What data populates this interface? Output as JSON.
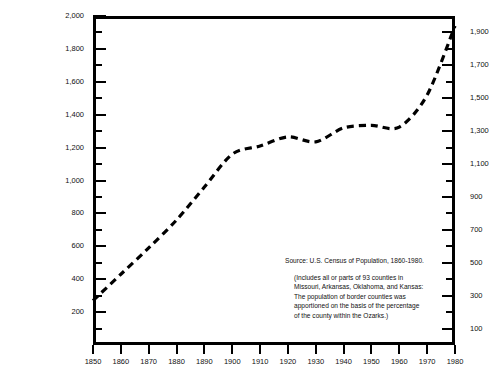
{
  "chart_data": {
    "type": "line",
    "title": "",
    "xlabel": "",
    "ylabel": "",
    "x": [
      1850,
      1860,
      1870,
      1880,
      1890,
      1900,
      1910,
      1920,
      1930,
      1940,
      1950,
      1960,
      1970,
      1980
    ],
    "values": [
      270,
      430,
      590,
      760,
      960,
      1160,
      1210,
      1265,
      1235,
      1320,
      1335,
      1325,
      1520,
      1940
    ],
    "series": [
      {
        "name": "Ozarks population (thousands)",
        "values": [
          270,
          430,
          590,
          760,
          960,
          1160,
          1210,
          1265,
          1235,
          1320,
          1335,
          1325,
          1520,
          1940
        ]
      }
    ],
    "xlim": [
      1850,
      1980
    ],
    "ylim": [
      0,
      2000
    ],
    "grid": false,
    "legend": "none",
    "line_style": "dashed",
    "left_axis": {
      "ticks_major": [
        200,
        400,
        600,
        800,
        1000,
        1200,
        1400,
        1600,
        1800,
        2000
      ],
      "labels": [
        "200",
        "400",
        "600",
        "800",
        "1,000",
        "1,200",
        "1,400",
        "1,600",
        "1,800",
        "2,000"
      ],
      "ticks_minor": [
        100,
        300,
        500,
        700,
        900,
        1100,
        1300,
        1500,
        1700,
        1900
      ]
    },
    "right_axis": {
      "ticks_major": [
        100,
        300,
        500,
        700,
        900,
        1100,
        1300,
        1500,
        1700,
        1900
      ],
      "labels": [
        "100",
        "300",
        "500",
        "700",
        "900",
        "1,100",
        "1,300",
        "1,500",
        "1,700",
        "1,900"
      ],
      "ticks_minor": [
        200,
        400,
        600,
        800,
        1000,
        1200,
        1400,
        1600,
        1800,
        2000
      ]
    },
    "x_axis": {
      "ticks": [
        1850,
        1860,
        1870,
        1880,
        1890,
        1900,
        1910,
        1920,
        1930,
        1940,
        1950,
        1960,
        1970,
        1980
      ],
      "labels": [
        "1850",
        "1860",
        "1870",
        "1880",
        "1890",
        "1900",
        "1910",
        "1920",
        "1930",
        "1940",
        "1950",
        "1960",
        "1970",
        "1980"
      ]
    }
  },
  "note": {
    "source": "Source: U.S. Census of Population, 1860-1980.",
    "lines": [
      "(Includes all or parts of 93 counties in",
      "Missouri, Arkansas, Oklahoma, and Kansas:",
      "The population of border counties was",
      "apportioned on the basis of the percentage",
      "of the county within the Ozarks.)"
    ]
  },
  "colors": {
    "line": "#000000",
    "axis": "#000000",
    "background": "#ffffff",
    "text": "#111111"
  }
}
